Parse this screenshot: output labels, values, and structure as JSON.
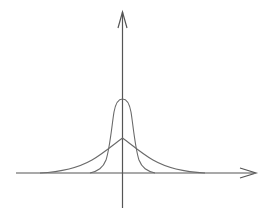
{
  "diagram": {
    "title": "",
    "colors": {
      "background": "#ffffff",
      "axis": "#555555",
      "curve": "#6a6a6a"
    },
    "axes": {
      "x_axis": {
        "label": "",
        "has_arrow": true
      },
      "y_axis": {
        "label": "",
        "has_arrow": true
      }
    },
    "curves": [
      {
        "name": "narrow-tall-curve",
        "shape": "gaussian",
        "peak_relative_height": 1.0,
        "relative_width": "narrow"
      },
      {
        "name": "wide-short-curve",
        "shape": "laplace-like",
        "peak_relative_height": 0.46,
        "relative_width": "wide"
      }
    ]
  }
}
